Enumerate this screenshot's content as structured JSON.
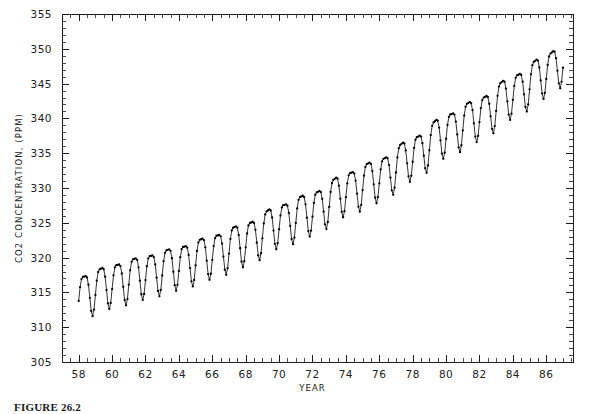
{
  "caption": {
    "text": "FIGURE 26.2"
  },
  "chart_data": {
    "type": "line",
    "title": "",
    "xlabel": "YEAR",
    "ylabel": "CO2 CONCENTRATION, (PPM)",
    "xlim": [
      57.0,
      87.6
    ],
    "ylim": [
      305,
      355
    ],
    "grid": false,
    "legend": null,
    "x_tick_labels": [
      "58",
      "60",
      "62",
      "64",
      "66",
      "68",
      "70",
      "72",
      "74",
      "76",
      "78",
      "80",
      "82",
      "84",
      "86"
    ],
    "x_tick_values": [
      58,
      60,
      62,
      64,
      66,
      68,
      70,
      72,
      74,
      76,
      78,
      80,
      82,
      84,
      86
    ],
    "x_minor_step": 0.5,
    "y_tick_labels": [
      "305",
      "310",
      "315",
      "320",
      "325",
      "330",
      "335",
      "340",
      "345",
      "350",
      "355"
    ],
    "y_tick_values": [
      305,
      310,
      315,
      320,
      325,
      330,
      335,
      340,
      345,
      350,
      355
    ],
    "y_minor_step": 1,
    "series_name": "Mauna Loa monthly mean CO2",
    "marker": "dot",
    "sampling_per_year": 12,
    "x_start": 58.0,
    "x_end": 87.0,
    "trend_anchors": [
      {
        "x": 58.0,
        "y": 314.9
      },
      {
        "x": 60.0,
        "y": 316.6
      },
      {
        "x": 62.0,
        "y": 317.9
      },
      {
        "x": 64.0,
        "y": 319.2
      },
      {
        "x": 66.0,
        "y": 320.8
      },
      {
        "x": 68.0,
        "y": 322.6
      },
      {
        "x": 70.0,
        "y": 325.2
      },
      {
        "x": 72.0,
        "y": 327.0
      },
      {
        "x": 74.0,
        "y": 329.8
      },
      {
        "x": 76.0,
        "y": 331.8
      },
      {
        "x": 78.0,
        "y": 334.9
      },
      {
        "x": 80.0,
        "y": 338.2
      },
      {
        "x": 82.0,
        "y": 340.6
      },
      {
        "x": 84.0,
        "y": 343.8
      },
      {
        "x": 86.0,
        "y": 346.8
      },
      {
        "x": 87.0,
        "y": 348.4
      }
    ],
    "seasonal_amplitude": 3.1,
    "seasonal_peak_month": 5,
    "seasonal_harmonic2": 0.85
  },
  "plot_geometry": {
    "left": 62,
    "right": 573,
    "top": 14,
    "bottom": 362
  }
}
